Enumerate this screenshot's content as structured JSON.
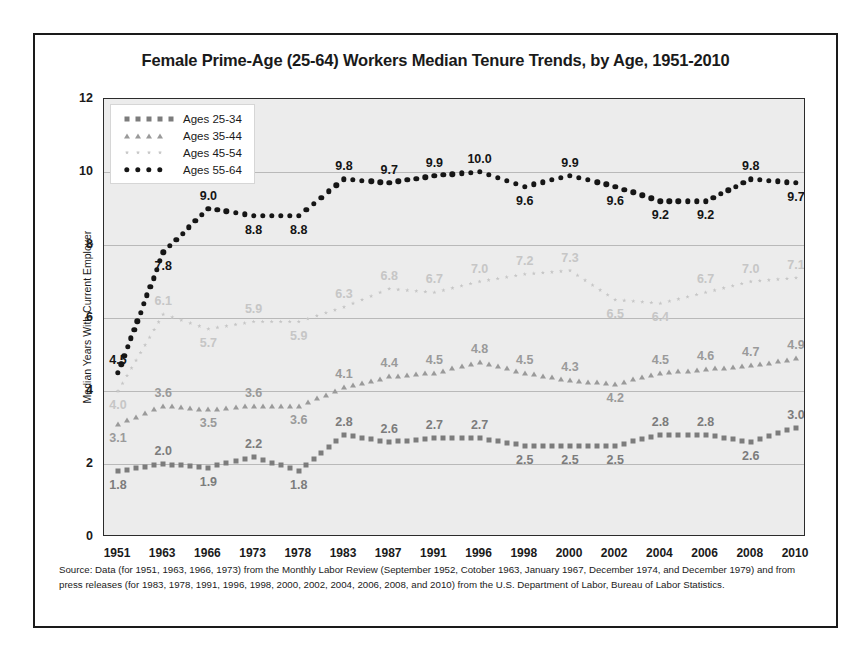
{
  "figure": {
    "title": "Female Prime-Age (25-64) Workers Median Tenure Trends, by Age, 1951-2010",
    "source_note": "Source: Data (for 1951, 1963, 1966, 1973) from the Monthly Labor Review (September 1952, Cotober 1963, January 1967, December 1974, and December 1979) and from press releases (for 1983, 1978, 1991, 1996, 1998, 2000, 2002, 2004, 2006, 2008, and 2010) from the U.S. Department of Labor, Bureau of Labor Statistics."
  },
  "chart_data": {
    "type": "line",
    "title": "Female Prime-Age (25-64) Workers Median Tenure Trends, by Age, 1951-2010",
    "xlabel": "",
    "ylabel": "Median Years With Current Employer",
    "categories": [
      "1951",
      "1963",
      "1966",
      "1973",
      "1978",
      "1983",
      "1987",
      "1991",
      "1996",
      "1998",
      "2000",
      "2002",
      "2004",
      "2006",
      "2008",
      "2010"
    ],
    "ylim": [
      0,
      12
    ],
    "yticks": [
      "0",
      "2",
      "4",
      "6",
      "8",
      "10",
      "12"
    ],
    "grid": true,
    "legend_position": "top-left",
    "series": [
      {
        "name": "Ages 25-34",
        "color": "#7c7c7c",
        "marker": "square",
        "values": [
          1.8,
          2.0,
          1.9,
          2.2,
          1.8,
          2.8,
          2.6,
          2.7,
          2.7,
          2.5,
          2.5,
          2.5,
          2.8,
          2.8,
          2.6,
          3.0
        ],
        "label_side": [
          "below",
          "above",
          "below",
          "above",
          "below",
          "above",
          "above",
          "above",
          "above",
          "below",
          "below",
          "below",
          "above",
          "above",
          "below",
          "above"
        ]
      },
      {
        "name": "Ages 35-44",
        "color": "#9a9a9a",
        "marker": "triangle",
        "values": [
          3.1,
          3.6,
          3.5,
          3.6,
          3.6,
          4.1,
          4.4,
          4.5,
          4.8,
          4.5,
          4.3,
          4.2,
          4.5,
          4.6,
          4.7,
          4.9
        ],
        "label_side": [
          "below",
          "above",
          "below",
          "above",
          "below",
          "above",
          "above",
          "above",
          "above",
          "above",
          "above",
          "below",
          "above",
          "above",
          "above",
          "above"
        ]
      },
      {
        "name": "Ages 45-54",
        "color": "#c6c6c6",
        "marker": "star",
        "values": [
          4.0,
          6.1,
          5.7,
          5.9,
          5.9,
          6.3,
          6.8,
          6.7,
          7.0,
          7.2,
          7.3,
          6.5,
          6.4,
          6.7,
          7.0,
          7.1
        ],
        "label_side": [
          "below",
          "above",
          "below",
          "above",
          "below",
          "above",
          "above",
          "above",
          "above",
          "above",
          "above",
          "below",
          "below",
          "above",
          "above",
          "above"
        ]
      },
      {
        "name": "Ages 55-64",
        "color": "#161616",
        "marker": "circle",
        "values": [
          4.5,
          7.8,
          9.0,
          8.8,
          8.8,
          9.8,
          9.7,
          9.9,
          10.0,
          9.6,
          9.9,
          9.6,
          9.2,
          9.2,
          9.8,
          9.7
        ],
        "label_side": [
          "above",
          "below",
          "above",
          "below",
          "below",
          "above",
          "above",
          "above",
          "above",
          "below",
          "above",
          "below",
          "below",
          "below",
          "above",
          "below"
        ]
      }
    ]
  }
}
